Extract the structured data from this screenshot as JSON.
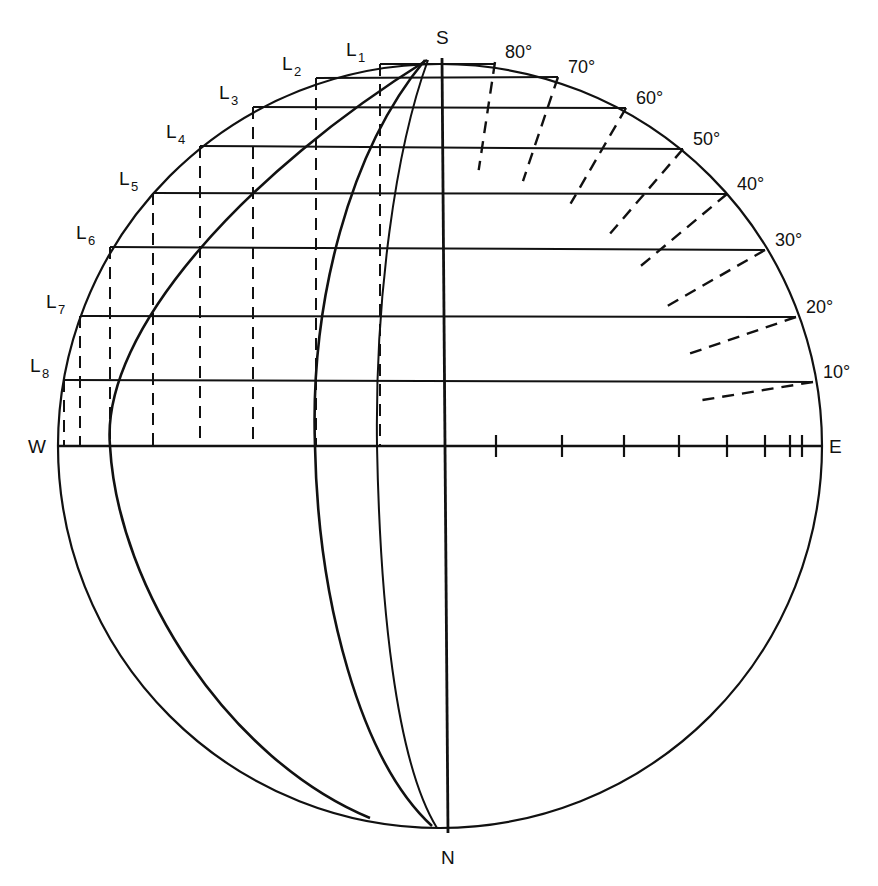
{
  "diagram": {
    "type": "stereographic-projection",
    "stroke_color": "#111111",
    "background": "#ffffff",
    "circle": {
      "cx": 440,
      "cy": 446,
      "r": 382
    },
    "poles": {
      "top": "S",
      "bottom": "N",
      "left": "W",
      "right": "E"
    },
    "left_points": [
      {
        "label": "L",
        "sub": "1",
        "x": 380,
        "y": 64
      },
      {
        "label": "L",
        "sub": "2",
        "x": 316,
        "y": 78
      },
      {
        "label": "L",
        "sub": "3",
        "x": 253,
        "y": 107
      },
      {
        "label": "L",
        "sub": "4",
        "x": 200,
        "y": 146
      },
      {
        "label": "L",
        "sub": "5",
        "x": 153,
        "y": 193
      },
      {
        "label": "L",
        "sub": "6",
        "x": 110,
        "y": 247
      },
      {
        "label": "L",
        "sub": "7",
        "x": 80,
        "y": 316
      },
      {
        "label": "L",
        "sub": "8",
        "x": 64,
        "y": 380
      }
    ],
    "right_angles": [
      {
        "label": "80°",
        "x": 495,
        "y": 62
      },
      {
        "label": "70°",
        "x": 558,
        "y": 77
      },
      {
        "label": "60°",
        "x": 626,
        "y": 108
      },
      {
        "label": "50°",
        "x": 683,
        "y": 149
      },
      {
        "label": "40°",
        "x": 727,
        "y": 194
      },
      {
        "label": "30°",
        "x": 765,
        "y": 250
      },
      {
        "label": "20°",
        "x": 796,
        "y": 317
      },
      {
        "label": "10°",
        "x": 813,
        "y": 382
      }
    ],
    "equator_ticks_x": [
      496,
      562,
      624,
      679,
      727,
      765,
      790,
      802
    ],
    "dashed_verticals_x": [
      64,
      80,
      110,
      153,
      200,
      253,
      316,
      380
    ]
  }
}
